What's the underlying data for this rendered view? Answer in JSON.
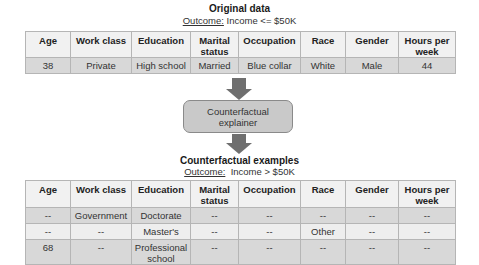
{
  "original": {
    "title": "Original data",
    "outcome_label": "Outcome:",
    "outcome_value": " Income <= $50K",
    "headers": [
      "Age",
      "Work class",
      "Education",
      "Marital status",
      "Occupation",
      "Race",
      "Gender",
      "Hours per week"
    ],
    "rows": [
      [
        "38",
        "Private",
        "High school",
        "Married",
        "Blue collar",
        "White",
        "Male",
        "44"
      ]
    ]
  },
  "explainer": {
    "label": "Counterfactual explainer"
  },
  "counterfactual": {
    "title": "Counterfactual examples",
    "outcome_label": "Outcome:",
    "outcome_value": "  Income > $50K",
    "headers": [
      "Age",
      "Work class",
      "Education",
      "Marital status",
      "Occupation",
      "Race",
      "Gender",
      "Hours per week"
    ],
    "rows": [
      [
        "--",
        "Government",
        "Doctorate",
        "--",
        "--",
        "--",
        "--",
        "--"
      ],
      [
        "--",
        "--",
        "Master's",
        "--",
        "--",
        "Other",
        "--",
        "--"
      ],
      [
        "68",
        "--",
        "Professional school",
        "--",
        "--",
        "--",
        "--",
        "--"
      ]
    ]
  },
  "colors": {
    "header_bg": "#f1f1f1",
    "row_dark": "#d8d8d8",
    "row_light": "#eeeeee",
    "arrow": "#6f6f6f",
    "box_fill": "#c9c9c9",
    "border": "#b5b5b5"
  }
}
